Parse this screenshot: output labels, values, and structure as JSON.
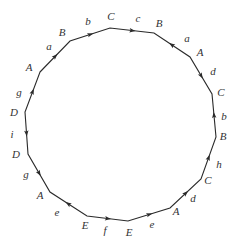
{
  "diagram": {
    "type": "polygon-word-diagram",
    "stroke_color": "#2a2a2a",
    "label_color": "#333333",
    "vertices": [
      {
        "id": "v0",
        "label": "A",
        "x": 40,
        "y": 72,
        "lx": 29,
        "ly": 71
      },
      {
        "id": "v1",
        "label": "B",
        "x": 70,
        "y": 41,
        "lx": 62,
        "ly": 36
      },
      {
        "id": "v2",
        "label": "C",
        "x": 110,
        "y": 28,
        "lx": 111,
        "ly": 20
      },
      {
        "id": "v3",
        "label": "B",
        "x": 154,
        "y": 33,
        "lx": 159,
        "ly": 27
      },
      {
        "id": "v4",
        "label": "A",
        "x": 190,
        "y": 57,
        "lx": 200,
        "ly": 56
      },
      {
        "id": "v5",
        "label": "C",
        "x": 212,
        "y": 94,
        "lx": 221,
        "ly": 96
      },
      {
        "id": "v6",
        "label": "B",
        "x": 216,
        "y": 137,
        "lx": 223,
        "ly": 140
      },
      {
        "id": "v7",
        "label": "C",
        "x": 201,
        "y": 179,
        "lx": 208,
        "ly": 184
      },
      {
        "id": "v8",
        "label": "A",
        "x": 170,
        "y": 208,
        "lx": 176,
        "ly": 215
      },
      {
        "id": "v9",
        "label": "E",
        "x": 128,
        "y": 221,
        "lx": 129,
        "ly": 236
      },
      {
        "id": "v10",
        "label": "E",
        "x": 87,
        "y": 216,
        "lx": 85,
        "ly": 229
      },
      {
        "id": "v11",
        "label": "A",
        "x": 50,
        "y": 192,
        "lx": 40,
        "ly": 199
      },
      {
        "id": "v12",
        "label": "D",
        "x": 28,
        "y": 154,
        "lx": 16,
        "ly": 158
      },
      {
        "id": "v13",
        "label": "D",
        "x": 25,
        "y": 112,
        "lx": 14,
        "ly": 116
      }
    ],
    "edges": [
      {
        "from": "v0",
        "to": "v1",
        "label": "a",
        "arrow_toward": "v1",
        "lx": 49,
        "ly": 50
      },
      {
        "from": "v1",
        "to": "v2",
        "label": "b",
        "arrow_toward": "v2",
        "lx": 88,
        "ly": 25
      },
      {
        "from": "v2",
        "to": "v3",
        "label": "c",
        "arrow_toward": "v3",
        "lx": 138,
        "ly": 22
      },
      {
        "from": "v3",
        "to": "v4",
        "label": "a",
        "arrow_toward": "v3",
        "lx": 187,
        "ly": 42
      },
      {
        "from": "v4",
        "to": "v5",
        "label": "d",
        "arrow_toward": "v5",
        "lx": 213,
        "ly": 75
      },
      {
        "from": "v5",
        "to": "v6",
        "label": "b",
        "arrow_toward": "v5",
        "lx": 224,
        "ly": 120
      },
      {
        "from": "v6",
        "to": "v7",
        "label": "h",
        "arrow_toward": "v6",
        "lx": 219,
        "ly": 168
      },
      {
        "from": "v7",
        "to": "v8",
        "label": "d",
        "arrow_toward": "v7",
        "lx": 193,
        "ly": 202
      },
      {
        "from": "v8",
        "to": "v9",
        "label": "e",
        "arrow_toward": "v8",
        "lx": 152,
        "ly": 228
      },
      {
        "from": "v9",
        "to": "v10",
        "label": "f",
        "arrow_toward": "v9",
        "lx": 105,
        "ly": 234
      },
      {
        "from": "v10",
        "to": "v11",
        "label": "e",
        "arrow_toward": "v11",
        "lx": 57,
        "ly": 216
      },
      {
        "from": "v11",
        "to": "v12",
        "label": "g",
        "arrow_toward": "v11",
        "lx": 26,
        "ly": 178
      },
      {
        "from": "v12",
        "to": "v13",
        "label": "i",
        "arrow_toward": "v12",
        "lx": 12,
        "ly": 138
      },
      {
        "from": "v13",
        "to": "v0",
        "label": "g",
        "arrow_toward": "v0",
        "lx": 19,
        "ly": 96
      }
    ]
  }
}
